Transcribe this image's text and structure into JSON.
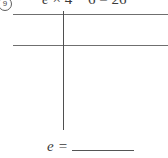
{
  "worksheet": {
    "item_marker": "9",
    "equation": {
      "variable": "e",
      "times_symbol": "×",
      "factor": "4",
      "minus_symbol": "−",
      "subtrahend": "6",
      "equals_symbol": "=",
      "result": "26",
      "full_text": "e × 4 − 6 = 26"
    },
    "work_area": {
      "description": "blank ruled work grid",
      "rows_label": "",
      "columns_label": ""
    },
    "answer": {
      "label": "e",
      "equals": "=",
      "value": ""
    }
  },
  "colors": {
    "ink": "#3a3a3a",
    "rule": "#6f6f6f",
    "page": "#ffffff"
  }
}
